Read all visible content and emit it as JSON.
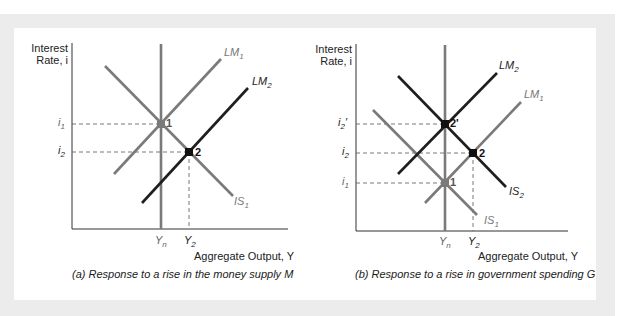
{
  "panel_a": {
    "y_axis_title_line1": "Interest",
    "y_axis_title_line2": "Rate, i",
    "x_axis_title": "Aggregate Output, Y",
    "caption": "(a) Response to a rise in the money supply M",
    "curves": {
      "IS1": "IS1",
      "LM1": "LM1",
      "LM2": "LM2"
    },
    "y_ticks": [
      "i1",
      "i2"
    ],
    "x_ticks": [
      "Yn",
      "Y2"
    ],
    "points": [
      "1",
      "2"
    ]
  },
  "panel_b": {
    "y_axis_title_line1": "Interest",
    "y_axis_title_line2": "Rate, i",
    "x_axis_title": "Aggregate Output, Y",
    "caption": "(b) Response to a rise in government spending G",
    "curves": {
      "IS1": "IS1",
      "IS2": "IS2",
      "LM1": "LM1",
      "LM2": "LM2"
    },
    "y_ticks": [
      "i2'",
      "i2",
      "i1"
    ],
    "x_ticks": [
      "Yn",
      "Y2"
    ],
    "points": [
      "2'",
      "2",
      "1"
    ]
  },
  "colors": {
    "initial_curve": "#7a7a7a",
    "shifted_curve": "#1e1e1e",
    "axis": "#333333",
    "dashed": "#555555",
    "frame": "#ececec"
  }
}
